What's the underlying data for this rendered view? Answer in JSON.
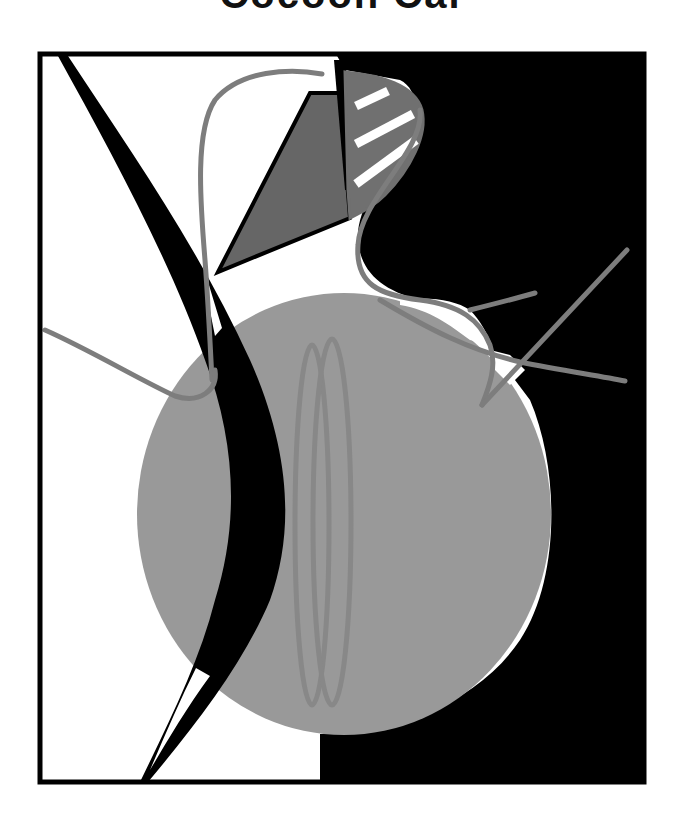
{
  "title": {
    "text": "Cocoon Cal",
    "visibility": "cropped at top edge; only lower portion of bold letters visible"
  },
  "artwork": {
    "description": "Abstract composition: black and white split background inside a black frame, large gray disc, black crescent blade, dark gray polygon, striped gray sail shape, and thin gray curved lines",
    "colors": {
      "background": "#ffffff",
      "frame": "#000000",
      "black_field": "#000000",
      "disc_gray": "#999999",
      "dark_gray_shape": "#666666",
      "line_gray": "#808080",
      "loop_gray": "#8a8a8a",
      "stripe_white": "#ffffff"
    },
    "elements": [
      {
        "name": "frame",
        "shape": "rectangle"
      },
      {
        "name": "black-field",
        "shape": "polygon"
      },
      {
        "name": "gray-disc",
        "shape": "ellipse"
      },
      {
        "name": "black-crescent-blade",
        "shape": "path"
      },
      {
        "name": "dark-gray-polygon",
        "shape": "polygon"
      },
      {
        "name": "striped-sail",
        "shape": "path"
      },
      {
        "name": "double-loops",
        "shape": "two ellipses"
      },
      {
        "name": "gray-curve-lines",
        "shape": "paths"
      }
    ]
  }
}
